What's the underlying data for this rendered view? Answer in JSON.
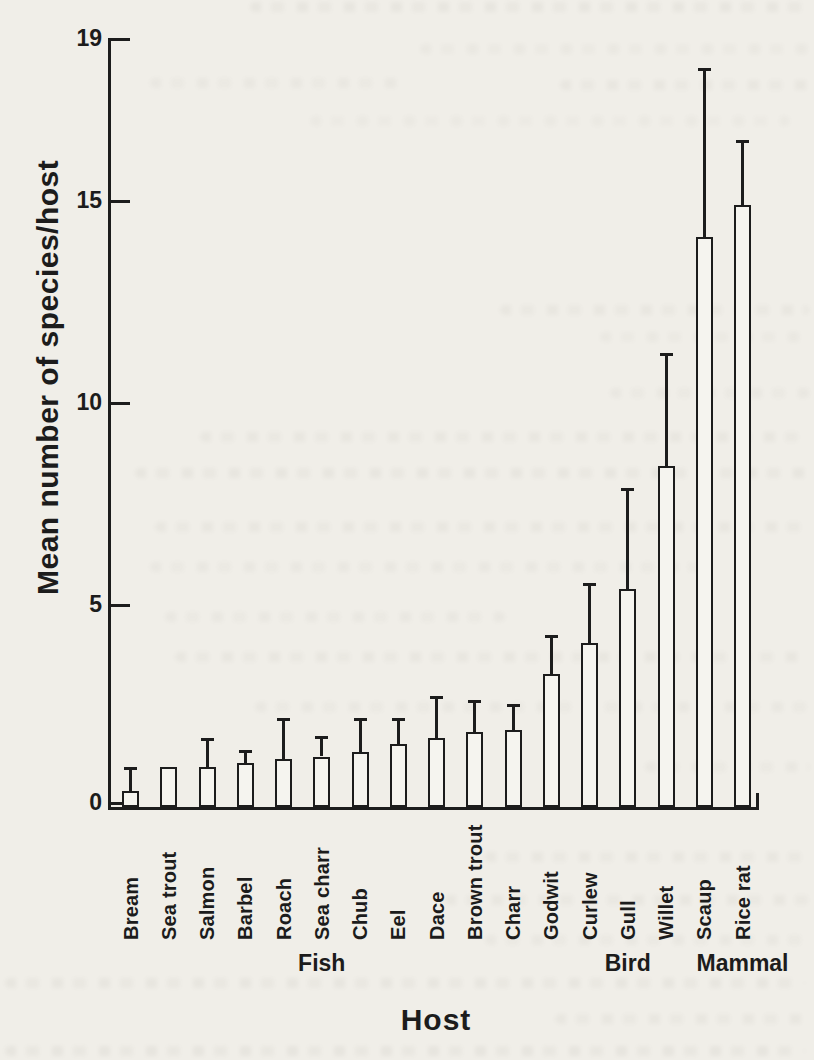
{
  "chart_data": {
    "type": "bar",
    "title": "",
    "xlabel": "Host",
    "ylabel": "Mean number of species/host",
    "ylim": [
      0,
      19
    ],
    "yticks": [
      19,
      15,
      10,
      5,
      0
    ],
    "grid": false,
    "legend": "none",
    "bar_fill": "#f5f4ef",
    "ink_color": "#1c1c1c",
    "error_bars": "upper whisker with cap",
    "categories": [
      "Bream",
      "Sea trout",
      "Salmon",
      "Barbel",
      "Roach",
      "Sea charr",
      "Chub",
      "Eel",
      "Dace",
      "Brown trout",
      "Charr",
      "Godwit",
      "Curlew",
      "Gull",
      "Willet",
      "Scaup",
      "Rice rat"
    ],
    "series": [
      {
        "name": "Mean number of species/host",
        "values": [
          0.4,
          1.0,
          1.0,
          1.1,
          1.2,
          1.25,
          1.35,
          1.55,
          1.7,
          1.85,
          1.9,
          3.3,
          4.05,
          5.4,
          8.45,
          14.1,
          14.9
        ]
      }
    ],
    "error_upper_tops": [
      1.0,
      null,
      1.7,
      1.4,
      2.2,
      1.75,
      2.2,
      2.2,
      2.75,
      2.65,
      2.55,
      4.25,
      5.55,
      7.9,
      11.25,
      18.3,
      16.5
    ],
    "groups": [
      {
        "label": "Fish",
        "from": 0,
        "to": 10
      },
      {
        "label": "Bird",
        "from": 11,
        "to": 15
      },
      {
        "label": "Mammal",
        "from": 16,
        "to": 16
      }
    ]
  }
}
